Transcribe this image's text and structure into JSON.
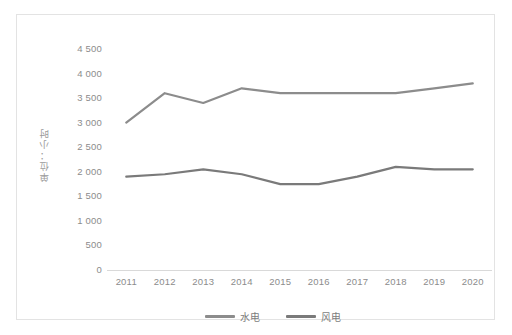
{
  "chart_data": {
    "type": "line",
    "title": "",
    "subtitle": "",
    "xlabel": "",
    "ylabel": "单位：小时",
    "categories": [
      "2011",
      "2012",
      "2013",
      "2014",
      "2015",
      "2016",
      "2017",
      "2018",
      "2019",
      "2020"
    ],
    "series": [
      {
        "name": "水电",
        "color": "#8c8c8c",
        "values": [
          3000,
          3600,
          3400,
          3700,
          3600,
          3600,
          3600,
          3600,
          3700,
          3800
        ]
      },
      {
        "name": "风电",
        "color": "#7a7a7a",
        "values": [
          1900,
          1950,
          2050,
          1950,
          1750,
          1750,
          1900,
          2100,
          2050,
          2050
        ]
      }
    ],
    "ylim": [
      0,
      4500
    ],
    "ytick_step": 500,
    "yticks": [
      "0",
      "500",
      "1 000",
      "1 500",
      "2 000",
      "2 500",
      "3 000",
      "3 500",
      "4 000",
      "4 500"
    ],
    "grid": false,
    "legend_position": "bottom"
  },
  "legend": {
    "items": [
      {
        "label": "水电",
        "color": "#8c8c8c"
      },
      {
        "label": "风电",
        "color": "#7a7a7a"
      }
    ]
  },
  "axis": {
    "y_title": "单位：小时"
  }
}
